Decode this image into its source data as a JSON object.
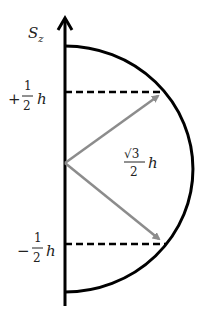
{
  "diagram": {
    "axis_label": {
      "main": "S",
      "sub": "z"
    },
    "upper_label": {
      "sign": "+",
      "num": "1",
      "den": "2",
      "unit": "h"
    },
    "lower_label": {
      "sign": "−",
      "num": "1",
      "den": "2",
      "unit": "h"
    },
    "vector_label": {
      "num": "√3",
      "den": "2",
      "unit": "h"
    },
    "colors": {
      "axis": "#000000",
      "arc": "#000000",
      "dashed": "#000000",
      "vector": "#8c8c8c"
    }
  }
}
